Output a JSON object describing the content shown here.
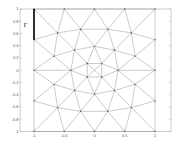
{
  "figure": {
    "type": "mesh",
    "boundary_label": "Γ",
    "boundary_segment": {
      "from": [
        -1,
        1
      ],
      "to": [
        -1,
        0.5
      ]
    },
    "colors": {
      "mesh_line": "#8a8a8a",
      "frame": "#9a9a9a",
      "boundary": "#000000",
      "node": "#555555",
      "background": "#ffffff"
    }
  },
  "chart_data": {
    "type": "mesh",
    "title": "",
    "xlabel": "",
    "ylabel": "",
    "xlim": [
      -1.25,
      1.25
    ],
    "ylim": [
      -1,
      1
    ],
    "grid": false,
    "x_ticks": [
      "-1",
      "-0.5",
      "0",
      "0.5",
      "1"
    ],
    "y_ticks": [
      "1",
      "0.8",
      "0.6",
      "0.4",
      "0.2",
      "0",
      "-0.2",
      "-0.4",
      "-0.6",
      "-0.8",
      "-1"
    ],
    "annotations": [
      {
        "text": "Γ",
        "x": -1.15,
        "y": 0.75
      }
    ],
    "nodes": {
      "T0": [
        -1,
        1
      ],
      "T1": [
        -0.5,
        1
      ],
      "T2": [
        0,
        1
      ],
      "T3": [
        0.5,
        1
      ],
      "T4": [
        1,
        1
      ],
      "L1": [
        -1,
        0.5
      ],
      "R1": [
        1,
        0.5
      ],
      "A0": [
        -0.61,
        0.61
      ],
      "A1": [
        -0.23,
        0.67
      ],
      "A2": [
        0.22,
        0.67
      ],
      "A3": [
        0.61,
        0.61
      ],
      "B0": [
        -0.67,
        0.23
      ],
      "B1": [
        -0.33,
        0.33
      ],
      "B2": [
        0,
        0.39
      ],
      "B3": [
        0.33,
        0.33
      ],
      "B4": [
        0.67,
        0.23
      ],
      "L0": [
        -1,
        0
      ],
      "C0": [
        -0.39,
        0
      ],
      "C1": [
        -0.12,
        0.11
      ],
      "C2": [
        0.12,
        0.11
      ],
      "C3": [
        0.39,
        0
      ],
      "R0": [
        1,
        0
      ],
      "D1": [
        -0.12,
        -0.11
      ],
      "D2": [
        0.12,
        -0.11
      ],
      "E0": [
        -0.67,
        -0.23
      ],
      "E1": [
        -0.33,
        -0.33
      ],
      "E2": [
        0,
        -0.39
      ],
      "E3": [
        0.33,
        -0.33
      ],
      "E4": [
        0.67,
        -0.23
      ],
      "L2": [
        -1,
        -0.5
      ],
      "R2": [
        1,
        -0.5
      ],
      "F0": [
        -0.61,
        -0.61
      ],
      "F1": [
        -0.23,
        -0.67
      ],
      "F2": [
        0.22,
        -0.67
      ],
      "F3": [
        0.61,
        -0.61
      ],
      "G0": [
        -1,
        -1
      ],
      "G1": [
        -0.5,
        -1
      ],
      "G2": [
        0,
        -1
      ],
      "G3": [
        0.5,
        -1
      ],
      "G4": [
        1,
        -1
      ]
    },
    "edges": [
      [
        "T0",
        "T1"
      ],
      [
        "T1",
        "T2"
      ],
      [
        "T2",
        "T3"
      ],
      [
        "T3",
        "T4"
      ],
      [
        "G0",
        "G1"
      ],
      [
        "G1",
        "G2"
      ],
      [
        "G2",
        "G3"
      ],
      [
        "G3",
        "G4"
      ],
      [
        "T0",
        "L1"
      ],
      [
        "L1",
        "L0"
      ],
      [
        "L0",
        "L2"
      ],
      [
        "L2",
        "G0"
      ],
      [
        "T4",
        "R1"
      ],
      [
        "R1",
        "R0"
      ],
      [
        "R0",
        "R2"
      ],
      [
        "R2",
        "G4"
      ],
      [
        "T0",
        "A0"
      ],
      [
        "T1",
        "A0"
      ],
      [
        "T1",
        "A1"
      ],
      [
        "T2",
        "A1"
      ],
      [
        "T2",
        "A2"
      ],
      [
        "T3",
        "A2"
      ],
      [
        "T3",
        "A3"
      ],
      [
        "T4",
        "A3"
      ],
      [
        "L1",
        "A0"
      ],
      [
        "A0",
        "A1"
      ],
      [
        "A1",
        "A2"
      ],
      [
        "A2",
        "A3"
      ],
      [
        "A3",
        "R1"
      ],
      [
        "A0",
        "B0"
      ],
      [
        "A0",
        "B1"
      ],
      [
        "A1",
        "B1"
      ],
      [
        "A1",
        "B2"
      ],
      [
        "A2",
        "B2"
      ],
      [
        "A2",
        "B3"
      ],
      [
        "A3",
        "B3"
      ],
      [
        "A3",
        "B4"
      ],
      [
        "L1",
        "B0"
      ],
      [
        "R1",
        "B4"
      ],
      [
        "B0",
        "B1"
      ],
      [
        "B1",
        "B2"
      ],
      [
        "B2",
        "B3"
      ],
      [
        "B3",
        "B4"
      ],
      [
        "L0",
        "B0"
      ],
      [
        "B0",
        "C0"
      ],
      [
        "B1",
        "C0"
      ],
      [
        "B1",
        "C1"
      ],
      [
        "B2",
        "C1"
      ],
      [
        "B2",
        "C2"
      ],
      [
        "B3",
        "C2"
      ],
      [
        "B3",
        "C3"
      ],
      [
        "B4",
        "C3"
      ],
      [
        "B4",
        "R0"
      ],
      [
        "L0",
        "C0"
      ],
      [
        "C3",
        "R0"
      ],
      [
        "C0",
        "C1"
      ],
      [
        "C1",
        "C2"
      ],
      [
        "C2",
        "C3"
      ],
      [
        "C0",
        "D1"
      ],
      [
        "D1",
        "D2"
      ],
      [
        "D2",
        "C3"
      ],
      [
        "C1",
        "D1"
      ],
      [
        "C2",
        "D2"
      ],
      [
        "C1",
        "D2"
      ],
      [
        "C2",
        "D1"
      ],
      [
        "L0",
        "E0"
      ],
      [
        "E0",
        "C0"
      ],
      [
        "E1",
        "C0"
      ],
      [
        "E1",
        "D1"
      ],
      [
        "E2",
        "D1"
      ],
      [
        "E2",
        "D2"
      ],
      [
        "E3",
        "D2"
      ],
      [
        "E3",
        "C3"
      ],
      [
        "E4",
        "C3"
      ],
      [
        "E4",
        "R0"
      ],
      [
        "E0",
        "E1"
      ],
      [
        "E1",
        "E2"
      ],
      [
        "E2",
        "E3"
      ],
      [
        "E3",
        "E4"
      ],
      [
        "L2",
        "E0"
      ],
      [
        "R2",
        "E4"
      ],
      [
        "F0",
        "E0"
      ],
      [
        "F0",
        "E1"
      ],
      [
        "F1",
        "E1"
      ],
      [
        "F1",
        "E2"
      ],
      [
        "F2",
        "E2"
      ],
      [
        "F2",
        "E3"
      ],
      [
        "F3",
        "E3"
      ],
      [
        "F3",
        "E4"
      ],
      [
        "L2",
        "F0"
      ],
      [
        "F0",
        "F1"
      ],
      [
        "F1",
        "F2"
      ],
      [
        "F2",
        "F3"
      ],
      [
        "F3",
        "R2"
      ],
      [
        "G0",
        "F0"
      ],
      [
        "G1",
        "F0"
      ],
      [
        "G1",
        "F1"
      ],
      [
        "G2",
        "F1"
      ],
      [
        "G2",
        "F2"
      ],
      [
        "G3",
        "F2"
      ],
      [
        "G3",
        "F3"
      ],
      [
        "G4",
        "F3"
      ]
    ]
  }
}
